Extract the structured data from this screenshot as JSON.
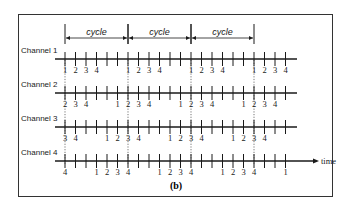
{
  "figure": {
    "label": "(b)",
    "time_label": "time",
    "cycle_label": "cycle",
    "cycles": 3,
    "ticks_per_cycle": 6,
    "colors": {
      "line": "#1a1a1a",
      "frame": "#333333",
      "background": "#ffffff"
    }
  },
  "channels": [
    {
      "name": "Channel 1",
      "labels": [
        "1",
        "2",
        "3",
        "4",
        "",
        "",
        "1",
        "2",
        "3",
        "4",
        "",
        "",
        "1",
        "2",
        "3",
        "4",
        "",
        "",
        "1",
        "2",
        "3",
        "4"
      ]
    },
    {
      "name": "Channel 2",
      "labels": [
        "2",
        "3",
        "4",
        "",
        "",
        "1",
        "2",
        "3",
        "4",
        "",
        "",
        "1",
        "2",
        "3",
        "4",
        "",
        "",
        "1",
        "2",
        "3",
        "4",
        ""
      ]
    },
    {
      "name": "Channel 3",
      "labels": [
        "3",
        "4",
        "",
        "",
        "1",
        "2",
        "3",
        "4",
        "",
        "",
        "1",
        "2",
        "3",
        "4",
        "",
        "",
        "1",
        "2",
        "3",
        "4",
        "",
        ""
      ]
    },
    {
      "name": "Channel 4",
      "labels": [
        "4",
        "",
        "",
        "1",
        "2",
        "3",
        "4",
        "",
        "",
        "1",
        "2",
        "3",
        "4",
        "",
        "",
        "1",
        "2",
        "3",
        "4",
        "",
        "",
        "1"
      ]
    }
  ]
}
